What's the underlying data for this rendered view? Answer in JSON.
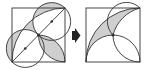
{
  "diagram": {
    "left_figure": {
      "label": "before",
      "elements": [
        "square",
        "quarter-circle-arc",
        "diagonal",
        "semicircle-upper",
        "semicircle-lower",
        "lens-to-corner",
        "midpoint-dot",
        "quarter-point-dots"
      ],
      "shaded_regions": [
        "upper-crescent",
        "lens"
      ]
    },
    "arrow": {
      "icon": "right-arrow-icon",
      "color": "#222222"
    },
    "right_figure": {
      "label": "after",
      "elements": [
        "square",
        "quarter-circle-arc",
        "semicircle-upper",
        "lens-to-corner",
        "midpoint-dot"
      ],
      "shaded_regions": [
        "combined-crescent"
      ]
    },
    "colors": {
      "stroke": "#333333",
      "shade": "#cfcfcf",
      "background": "#ffffff"
    }
  }
}
